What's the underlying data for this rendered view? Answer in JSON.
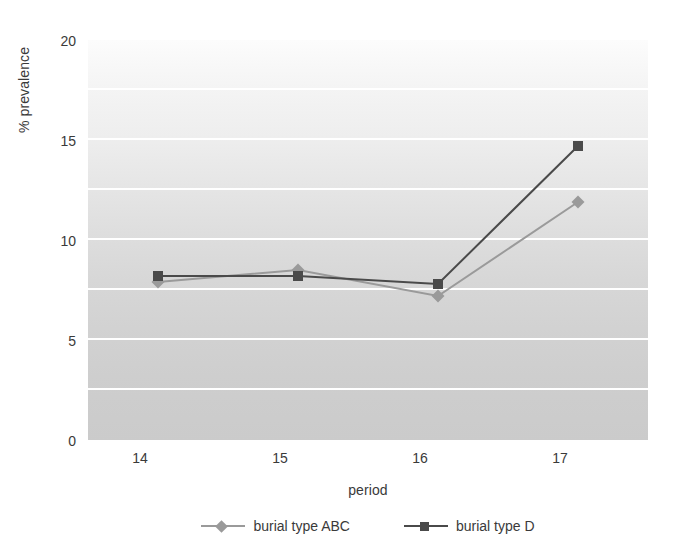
{
  "chart_data": {
    "type": "line",
    "title": "",
    "xlabel": "period",
    "ylabel": "% prevalence",
    "categories": [
      "14",
      "15",
      "16",
      "17"
    ],
    "x": [
      14,
      15,
      16,
      17
    ],
    "xlim": [
      13.5,
      17.5
    ],
    "ylim": [
      0,
      20
    ],
    "yticks": [
      0,
      5,
      10,
      15,
      20
    ],
    "ytick_labels": [
      "0",
      "5",
      "10",
      "15",
      "20"
    ],
    "gridlines_at": [
      2.5,
      5,
      7.5,
      10,
      12.5,
      15,
      17.5
    ],
    "grid": true,
    "grid_color": "#ffffff",
    "legend_position": "bottom",
    "series": [
      {
        "name": "burial type ABC",
        "values": [
          7.9,
          8.5,
          7.2,
          11.9
        ],
        "color": "#9a9a9a",
        "marker": "diamond"
      },
      {
        "name": "burial type D",
        "values": [
          8.2,
          8.2,
          7.8,
          14.7
        ],
        "color": "#4a4a4a",
        "marker": "square"
      }
    ]
  },
  "axes": {
    "y_title": "% prevalence",
    "x_title": "period",
    "y_tick_0": "0",
    "y_tick_1": "5",
    "y_tick_2": "10",
    "y_tick_3": "15",
    "y_tick_4": "20",
    "x_tick_0": "14",
    "x_tick_1": "15",
    "x_tick_2": "16",
    "x_tick_3": "17"
  },
  "legend": {
    "items": [
      {
        "label": "burial type ABC",
        "color": "#9a9a9a",
        "marker": "diamond-marker"
      },
      {
        "label": "burial type D",
        "color": "#4a4a4a",
        "marker": "square-marker"
      }
    ]
  }
}
